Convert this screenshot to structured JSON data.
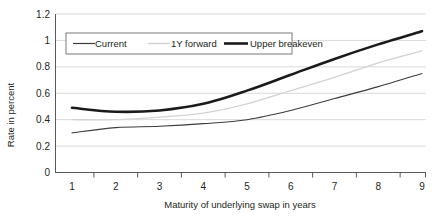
{
  "chart_data": {
    "type": "line",
    "title": "",
    "xlabel": "Maturity of underlying swap in years",
    "ylabel": "Rate in percent",
    "x": [
      1,
      2,
      3,
      4,
      5,
      6,
      7,
      8,
      9
    ],
    "categories": [
      "1",
      "2",
      "3",
      "4",
      "5",
      "6",
      "7",
      "8",
      "9"
    ],
    "xtick_labels": [
      "1",
      "2",
      "3",
      "4",
      "5",
      "6",
      "7",
      "8",
      "9"
    ],
    "ytick_labels": [
      "0",
      "0.2",
      "0.4",
      "0.6",
      "0.8",
      "1",
      "1.2"
    ],
    "ytick_values": [
      0,
      0.2,
      0.4,
      0.6,
      0.8,
      1,
      1.2
    ],
    "ylim": [
      0,
      1.2
    ],
    "xlim": [
      1,
      9
    ],
    "grid": "horizontal",
    "legend_position": "top-left-inside",
    "series": [
      {
        "name": "Current",
        "color": "#3c3c3c",
        "values": [
          0.3,
          0.34,
          0.35,
          0.37,
          0.4,
          0.47,
          0.56,
          0.65,
          0.75
        ]
      },
      {
        "name": "1Y forward",
        "color": "#d2d2d2",
        "values": [
          0.4,
          0.4,
          0.42,
          0.45,
          0.52,
          0.62,
          0.72,
          0.83,
          0.92
        ]
      },
      {
        "name": "Upper breakeven",
        "color": "#1a1a1a",
        "values": [
          0.49,
          0.46,
          0.47,
          0.52,
          0.62,
          0.74,
          0.86,
          0.97,
          1.07
        ]
      }
    ]
  },
  "legend": {
    "entries": [
      {
        "label": "Current",
        "style": "solid-dark-thin"
      },
      {
        "label": "1Y forward",
        "style": "solid-light-thin"
      },
      {
        "label": "Upper breakeven",
        "style": "solid-dark-thick"
      }
    ]
  },
  "axes": {
    "y_title": "Rate in percent",
    "x_title": "Maturity of underlying swap in years"
  }
}
